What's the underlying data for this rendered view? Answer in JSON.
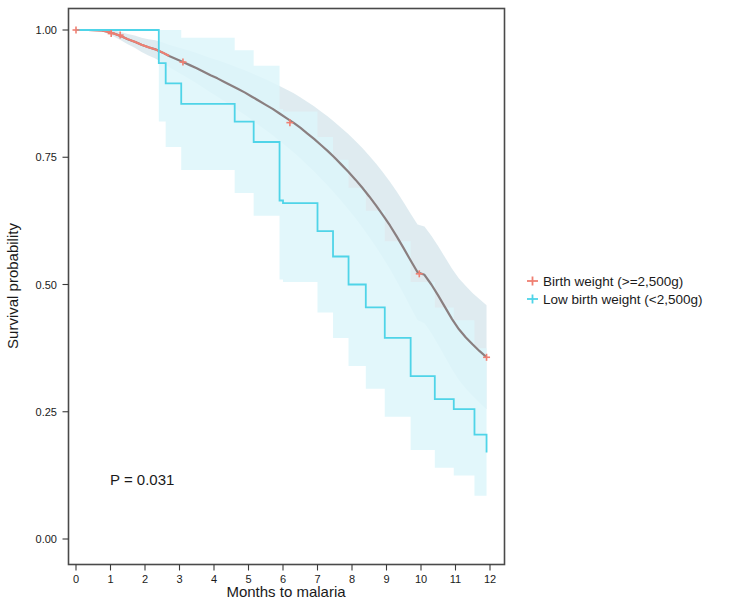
{
  "chart_data": {
    "type": "line",
    "subtype": "kaplan-meier-step",
    "title": "",
    "xlabel": "Months to malaria",
    "ylabel": "Survival probability",
    "xlim": [
      -0.25,
      12.4
    ],
    "ylim": [
      0.0,
      1.03
    ],
    "xticks": [
      0,
      1,
      2,
      3,
      4,
      5,
      6,
      7,
      8,
      9,
      10,
      11,
      12
    ],
    "xtick_labels": [
      "0",
      "1",
      "2",
      "3",
      "4",
      "5",
      "6",
      "7",
      "8",
      "9",
      "10",
      "11",
      "12"
    ],
    "yticks": [
      0.0,
      0.25,
      0.5,
      0.75,
      1.0
    ],
    "ytick_labels": [
      "0.00",
      "0.25",
      "0.50",
      "0.75",
      "1.00"
    ],
    "grid": false,
    "legend_position": "right",
    "annotations": [
      {
        "name": "p-value",
        "text": "P = 0.031",
        "x": 1.0,
        "y": 0.13
      }
    ],
    "series": [
      {
        "name": "Birth weight (>=2,500g)",
        "color": "#ef7f72",
        "band_color": "#dce9ee",
        "censor_marker": "plus",
        "x": [
          0.0,
          0.35,
          0.75,
          0.95,
          1.1,
          1.3,
          1.5,
          1.7,
          1.9,
          2.1,
          2.3,
          2.5,
          2.7,
          2.9,
          3.1,
          3.3,
          3.5,
          3.7,
          3.9,
          4.1,
          4.3,
          4.5,
          4.7,
          4.9,
          5.1,
          5.3,
          5.5,
          5.7,
          5.9,
          6.1,
          6.3,
          6.5,
          6.7,
          6.9,
          7.1,
          7.3,
          7.5,
          7.7,
          7.9,
          8.1,
          8.3,
          8.5,
          8.7,
          8.9,
          9.1,
          9.3,
          9.5,
          9.7,
          9.9,
          10.1,
          10.3,
          10.5,
          10.7,
          10.9,
          11.1,
          11.3,
          11.5,
          11.7,
          11.9
        ],
        "y": [
          1.0,
          1.0,
          0.999,
          0.996,
          0.993,
          0.988,
          0.982,
          0.977,
          0.971,
          0.966,
          0.962,
          0.956,
          0.949,
          0.943,
          0.937,
          0.931,
          0.925,
          0.918,
          0.911,
          0.905,
          0.898,
          0.891,
          0.884,
          0.877,
          0.869,
          0.861,
          0.853,
          0.845,
          0.836,
          0.827,
          0.818,
          0.808,
          0.797,
          0.786,
          0.774,
          0.762,
          0.749,
          0.735,
          0.721,
          0.706,
          0.69,
          0.673,
          0.655,
          0.636,
          0.616,
          0.594,
          0.571,
          0.547,
          0.524,
          0.519,
          0.5,
          0.478,
          0.455,
          0.432,
          0.412,
          0.396,
          0.382,
          0.369,
          0.357
        ],
        "band_lower": [
          1.0,
          1.0,
          0.997,
          0.992,
          0.987,
          0.98,
          0.972,
          0.965,
          0.957,
          0.95,
          0.944,
          0.936,
          0.927,
          0.919,
          0.911,
          0.903,
          0.895,
          0.886,
          0.877,
          0.869,
          0.86,
          0.851,
          0.842,
          0.833,
          0.823,
          0.813,
          0.803,
          0.793,
          0.782,
          0.771,
          0.76,
          0.748,
          0.735,
          0.722,
          0.708,
          0.694,
          0.679,
          0.663,
          0.647,
          0.63,
          0.612,
          0.593,
          0.573,
          0.552,
          0.53,
          0.506,
          0.481,
          0.455,
          0.43,
          0.424,
          0.404,
          0.381,
          0.357,
          0.333,
          0.312,
          0.295,
          0.281,
          0.267,
          0.255
        ],
        "band_upper": [
          1.0,
          1.0,
          1.0,
          1.0,
          0.999,
          0.996,
          0.992,
          0.989,
          0.985,
          0.982,
          0.98,
          0.976,
          0.971,
          0.967,
          0.963,
          0.959,
          0.955,
          0.95,
          0.945,
          0.941,
          0.936,
          0.931,
          0.926,
          0.921,
          0.915,
          0.909,
          0.903,
          0.897,
          0.89,
          0.883,
          0.876,
          0.868,
          0.859,
          0.85,
          0.84,
          0.83,
          0.819,
          0.807,
          0.795,
          0.782,
          0.768,
          0.753,
          0.737,
          0.72,
          0.702,
          0.682,
          0.661,
          0.639,
          0.618,
          0.614,
          0.596,
          0.575,
          0.553,
          0.531,
          0.512,
          0.497,
          0.483,
          0.471,
          0.459
        ],
        "censor_x": [
          0.0,
          1.02,
          1.28,
          3.1,
          6.2,
          9.95,
          11.9
        ],
        "censor_y": [
          1.0,
          0.993,
          0.99,
          0.937,
          0.818,
          0.521,
          0.357
        ]
      },
      {
        "name": "Low birth weight (<2,500g)",
        "color": "#4fd4e8",
        "band_color": "#ddf6fa",
        "censor_marker": "plus",
        "step_x": [
          0.0,
          2.4,
          2.4,
          2.6,
          2.6,
          3.05,
          3.05,
          4.6,
          4.6,
          5.15,
          5.15,
          5.9,
          5.9,
          6.0,
          6.0,
          7.0,
          7.0,
          7.45,
          7.45,
          7.9,
          7.9,
          8.4,
          8.4,
          8.95,
          8.95,
          9.7,
          9.7,
          10.4,
          10.4,
          10.95,
          10.95,
          11.55,
          11.55,
          11.9
        ],
        "step_y": [
          1.0,
          1.0,
          0.935,
          0.935,
          0.895,
          0.895,
          0.855,
          0.855,
          0.82,
          0.82,
          0.78,
          0.78,
          0.665,
          0.665,
          0.66,
          0.66,
          0.605,
          0.605,
          0.555,
          0.555,
          0.5,
          0.5,
          0.455,
          0.455,
          0.395,
          0.395,
          0.32,
          0.32,
          0.275,
          0.275,
          0.255,
          0.255,
          0.205,
          0.205
        ],
        "end_drop_x": 11.9,
        "end_drop_y": 0.17,
        "band_lower_step_y": [
          1.0,
          1.0,
          0.82,
          0.82,
          0.77,
          0.77,
          0.725,
          0.725,
          0.68,
          0.68,
          0.635,
          0.635,
          0.51,
          0.51,
          0.505,
          0.505,
          0.445,
          0.445,
          0.395,
          0.395,
          0.34,
          0.34,
          0.295,
          0.295,
          0.24,
          0.24,
          0.175,
          0.175,
          0.14,
          0.14,
          0.125,
          0.125,
          0.085,
          0.085
        ],
        "band_upper_step_y": [
          1.0,
          1.0,
          1.0,
          1.0,
          1.0,
          1.0,
          0.985,
          0.985,
          0.96,
          0.96,
          0.93,
          0.93,
          0.845,
          0.845,
          0.84,
          0.84,
          0.79,
          0.79,
          0.745,
          0.745,
          0.69,
          0.69,
          0.645,
          0.645,
          0.585,
          0.585,
          0.505,
          0.505,
          0.455,
          0.455,
          0.43,
          0.43,
          0.375,
          0.375
        ],
        "censor_x": [],
        "censor_y": []
      }
    ]
  },
  "legend": {
    "entries": [
      {
        "label": "Birth weight (>=2,500g)",
        "color": "#ef7f72"
      },
      {
        "label": "Low birth weight (<2,500g)",
        "color": "#4fd4e8"
      }
    ]
  },
  "axes": {
    "x_title": "Months to malaria",
    "y_title": "Survival probability",
    "x_tick_labels": [
      "0",
      "1",
      "2",
      "3",
      "4",
      "5",
      "6",
      "7",
      "8",
      "9",
      "10",
      "11",
      "12"
    ],
    "y_tick_labels": [
      "0.00",
      "0.25",
      "0.50",
      "0.75",
      "1.00"
    ]
  },
  "annotation": {
    "p_value_text": "P = 0.031"
  },
  "colors": {
    "series_normal_weight": "#ef7f72",
    "series_low_weight": "#4fd4e8",
    "band_normal_weight": "#dce9ee",
    "band_low_weight": "#ddf6fa",
    "frame": "#4a4a4a",
    "text": "#1a1a1a",
    "background": "#ffffff"
  }
}
